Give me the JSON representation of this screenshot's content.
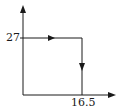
{
  "diagram": {
    "type": "process-path",
    "axes": {
      "x_axis": "horizontal arrow",
      "y_axis": "vertical arrow"
    },
    "labels": {
      "y_tick": "27",
      "x_tick": "16.5"
    },
    "path": [
      {
        "from": [
          0,
          27
        ],
        "to": [
          16.5,
          27
        ],
        "direction": "right"
      },
      {
        "from": [
          16.5,
          27
        ],
        "to": [
          16.5,
          0
        ],
        "direction": "down"
      }
    ],
    "colors": {
      "stroke": "#1a1a1a",
      "background": "#ffffff"
    }
  }
}
